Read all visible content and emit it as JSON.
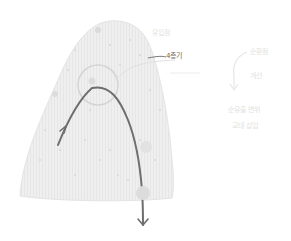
{
  "diagram": {
    "labels": {
      "top_label": "유입점",
      "pointer_label": "4층기",
      "right_top_label": "순환점",
      "right_mid_label": "개선",
      "right_bottom_line1": "순유출 변위",
      "right_bottom_line2": "교대 삽입"
    },
    "colors": {
      "mound_fill": "#ececec",
      "mound_dots": "#c8c8c8",
      "curve_stroke": "#6e6e6e",
      "circle_stroke": "#d2d2d2",
      "faint_text": "#e2e2e2",
      "dark_text": "#6a6a6a"
    }
  }
}
